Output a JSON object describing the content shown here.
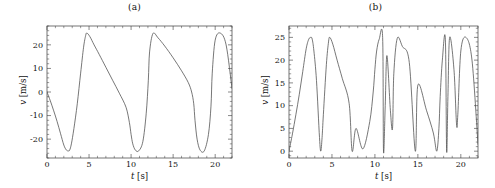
{
  "figure": {
    "background": "#ffffff",
    "line_color": "#4a4a4a",
    "axis_color": "#3a3a3a"
  },
  "panels": [
    {
      "id": "a",
      "title": "(a)",
      "xlabel_var": "t",
      "xlabel_unit": "[s]",
      "ylabel_var": "v",
      "ylabel_unit": "[m/s]",
      "xticks": [
        "0",
        "5",
        "10",
        "15",
        "20"
      ],
      "yticks": [
        "-20",
        "-10",
        "0",
        "10",
        "20"
      ]
    },
    {
      "id": "b",
      "title": "(b)",
      "xlabel_var": "t",
      "xlabel_unit": "[s]",
      "ylabel_var": "v",
      "ylabel_unit": "[m/s]",
      "xticks": [
        "0",
        "5",
        "10",
        "15",
        "20"
      ],
      "yticks": [
        "0",
        "5",
        "10",
        "15",
        "20",
        "25"
      ]
    }
  ],
  "chart_data": [
    {
      "type": "line",
      "panel": "a",
      "title": "(a)",
      "xlabel": "t [s]",
      "ylabel": "v [m/s]",
      "xlim": [
        0,
        22
      ],
      "ylim": [
        -28,
        28
      ],
      "xticks": [
        0,
        5,
        10,
        15,
        20
      ],
      "yticks": [
        -20,
        -10,
        0,
        10,
        20
      ],
      "grid": false,
      "legend": "none",
      "description": "Asymmetric sawtooth velocity: slow linear decay from +25 to -25 then rapid rounded rise back to +25. Period about 7.35 s.",
      "series": [
        {
          "name": "v(t)",
          "color": "#4a4a4a",
          "period": 7.35,
          "amplitude": 25,
          "x": [
            0.0,
            0.4,
            0.8,
            1.2,
            1.6,
            2.0,
            2.3,
            2.55,
            2.7,
            2.9,
            3.2,
            3.6,
            4.0,
            4.35,
            4.6,
            4.75,
            5.1,
            5.6,
            6.2,
            7.0,
            7.8,
            8.6,
            9.4,
            9.8,
            10.0,
            10.2,
            10.5,
            10.9,
            11.4,
            11.8,
            12.05,
            12.2,
            12.6,
            13.2,
            14.0,
            15.0,
            16.0,
            16.8,
            17.2,
            17.45,
            17.6,
            17.85,
            18.2,
            18.7,
            19.2,
            19.5,
            19.65,
            20.0,
            20.6,
            21.3,
            22.0
          ],
          "y": [
            0.0,
            -3.8,
            -8.0,
            -12.5,
            -17.5,
            -22.5,
            -24.6,
            -25.0,
            -24.6,
            -22.0,
            -15.5,
            -5.0,
            8.0,
            19.0,
            24.0,
            25.0,
            23.5,
            20.0,
            16.0,
            10.5,
            5.0,
            -0.5,
            -6.5,
            -13.0,
            -18.0,
            -22.0,
            -24.6,
            -25.0,
            -21.0,
            -9.0,
            5.0,
            17.0,
            24.8,
            23.0,
            19.5,
            14.5,
            9.0,
            4.0,
            0.0,
            -5.0,
            -12.0,
            -20.0,
            -24.6,
            -25.0,
            -18.0,
            -6.0,
            8.0,
            22.0,
            25.0,
            20.0,
            1.5
          ]
        }
      ]
    },
    {
      "type": "line",
      "panel": "b",
      "title": "(b)",
      "xlabel": "t [s]",
      "ylabel": "v [m/s]",
      "xlim": [
        0,
        22
      ],
      "ylim": [
        -1.5,
        27.5
      ],
      "xticks": [
        0,
        5,
        10,
        15,
        20
      ],
      "yticks": [
        0,
        5,
        10,
        15,
        20,
        25
      ],
      "grid": false,
      "legend": "none",
      "description": "Rectified (absolute value) of panel (a): rounded peaks at 25 m/s with sharp V-shaped zeros, zeros near t = 0, 3.7, 7.35, 11.0, 14.7, 18.35.",
      "series": [
        {
          "name": "|v(t)|",
          "color": "#4a4a4a",
          "period": 7.35,
          "amplitude": 25,
          "x": [
            0.0,
            0.4,
            0.8,
            1.2,
            1.6,
            2.0,
            2.3,
            2.55,
            2.7,
            2.9,
            3.2,
            3.55,
            3.7,
            3.85,
            4.0,
            4.35,
            4.6,
            4.75,
            5.1,
            5.6,
            6.2,
            7.0,
            7.35,
            7.8,
            8.6,
            9.4,
            9.8,
            10.0,
            10.2,
            10.5,
            10.9,
            11.0,
            11.2,
            11.4,
            11.8,
            12.05,
            12.2,
            12.6,
            13.2,
            14.0,
            14.7,
            15.0,
            16.0,
            16.8,
            17.2,
            17.45,
            17.6,
            17.85,
            18.2,
            18.35,
            18.5,
            18.7,
            19.2,
            19.5,
            19.65,
            20.0,
            20.6,
            21.3,
            22.0
          ],
          "y": [
            0.0,
            3.8,
            8.0,
            12.5,
            17.5,
            22.5,
            24.6,
            25.0,
            24.6,
            22.0,
            15.5,
            3.0,
            0.0,
            3.0,
            8.0,
            19.0,
            24.0,
            25.0,
            23.5,
            20.0,
            16.0,
            10.5,
            0.0,
            5.0,
            0.5,
            6.5,
            13.0,
            18.0,
            22.0,
            24.6,
            25.0,
            0.0,
            10.0,
            21.0,
            9.0,
            5.0,
            17.0,
            24.8,
            23.0,
            19.5,
            0.0,
            14.5,
            9.0,
            4.0,
            0.0,
            5.0,
            12.0,
            20.0,
            24.6,
            0.0,
            12.0,
            25.0,
            18.0,
            6.0,
            8.0,
            22.0,
            25.0,
            20.0,
            1.5
          ]
        }
      ]
    }
  ]
}
